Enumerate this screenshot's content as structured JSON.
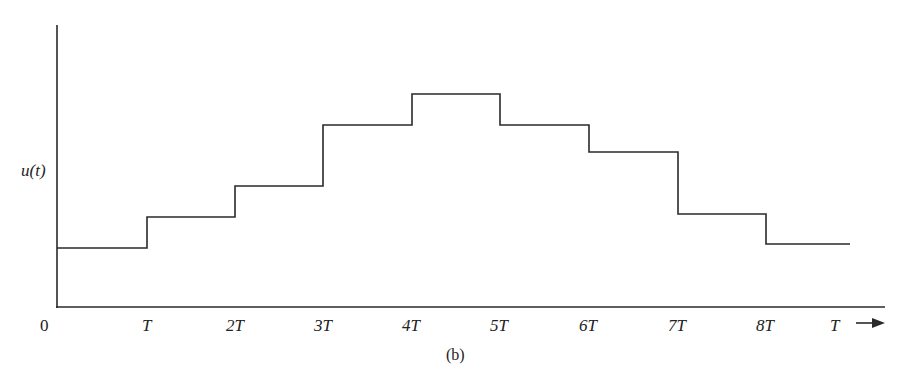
{
  "chart_data": {
    "type": "line",
    "subtype": "step",
    "title": "",
    "caption": "(b)",
    "ylabel": "u(t)",
    "xlabel": "T",
    "x_tick_labels": [
      "0",
      "T",
      "2T",
      "3T",
      "4T",
      "5T",
      "6T",
      "7T",
      "8T"
    ],
    "x_intervals": [
      "0-T",
      "T-2T",
      "2T-3T",
      "3T-4T",
      "4T-5T",
      "5T-6T",
      "6T-7T",
      "7T-8T",
      "8T-end"
    ],
    "values": [
      59,
      90,
      121,
      182,
      213,
      182,
      155,
      93,
      63
    ],
    "value_units": "relative height (pixels above axis)",
    "grid": false,
    "legend": null
  },
  "labels": {
    "y_axis": "u(t)",
    "x_axis_arrow_label": "T",
    "origin": "0",
    "ticks": [
      "T",
      "2T",
      "3T",
      "4T",
      "5T",
      "6T",
      "7T",
      "8T"
    ],
    "caption": "(b)"
  },
  "colors": {
    "line": "#2a2a2a",
    "background": "#ffffff"
  }
}
